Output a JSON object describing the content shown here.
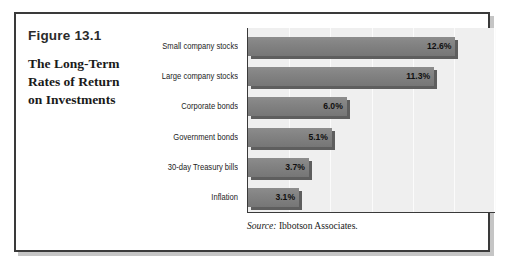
{
  "figure": {
    "number": "Figure 13.1",
    "title_lines": [
      "The Long-Term",
      "Rates of Return",
      "on Investments"
    ],
    "title_full": "The Long-Term Rates of Return on Investments"
  },
  "source": {
    "label": "Source:",
    "text": " Ibbotson Associates."
  },
  "style": {
    "bar_color": "#828282",
    "bar_shadow_color": "#5e5e5e",
    "plot_background": "#efefef",
    "gridline_color": "#fbfbfb",
    "axis_color": "#3a3a3a",
    "box_border_color": "#3a3a3a"
  },
  "chart_data": {
    "type": "bar",
    "orientation": "horizontal",
    "title": "The Long-Term Rates of Return on Investments",
    "categories": [
      "Small company stocks",
      "Large company stocks",
      "Corporate bonds",
      "Government bonds",
      "30-day Treasury bills",
      "Inflation"
    ],
    "values": [
      12.6,
      11.3,
      6.0,
      5.1,
      3.7,
      3.1
    ],
    "labels": [
      "12.6%",
      "11.3%",
      "6.0%",
      "5.1%",
      "3.7%",
      "3.1%"
    ],
    "xlabel": "",
    "ylabel": "",
    "xlim": [
      0,
      15
    ],
    "xticks": [
      0,
      2.5,
      5,
      7.5,
      10,
      12.5,
      15
    ],
    "grid": true,
    "legend": false,
    "source": "Source: Ibbotson Associates."
  }
}
